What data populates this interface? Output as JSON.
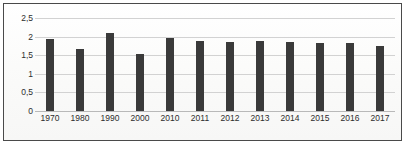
{
  "chart_data": {
    "type": "bar",
    "title": "",
    "xlabel": "",
    "ylabel": "",
    "categories": [
      "1970",
      "1980",
      "1990",
      "2000",
      "2010",
      "2011",
      "2012",
      "2013",
      "2014",
      "2015",
      "2016",
      "2017"
    ],
    "values": [
      1.93,
      1.68,
      2.11,
      1.52,
      1.97,
      1.87,
      1.86,
      1.87,
      1.86,
      1.84,
      1.84,
      1.74
    ],
    "series": [
      {
        "name": "",
        "values": [
          1.93,
          1.68,
          2.11,
          1.52,
          1.97,
          1.87,
          1.86,
          1.87,
          1.86,
          1.84,
          1.84,
          1.74
        ]
      }
    ],
    "ylim": [
      0,
      2.5
    ],
    "ytick_values": [
      0,
      0.5,
      1,
      1.5,
      2,
      2.5
    ],
    "ytick_labels": [
      "0",
      "0,5",
      "1",
      "1,5",
      "2",
      "2,5"
    ],
    "grid": true,
    "legend": false,
    "bar_color": "#3a3a3a",
    "gridline_color": "#d2d2d2",
    "border_color": "#4a4a4a",
    "decimal_separator": ","
  }
}
